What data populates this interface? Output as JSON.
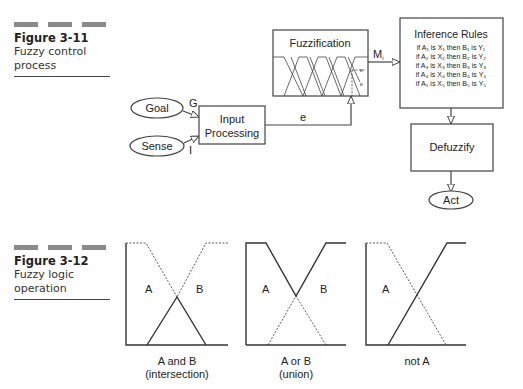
{
  "figure_3_11": {
    "number": "Figure 3-11",
    "title": "Fuzzy control process",
    "nodes": {
      "goal": "Goal",
      "sense": "Sense",
      "input_processing_line1": "Input",
      "input_processing_line2": "Processing",
      "fuzzification": "Fuzzification",
      "inference_title": "Inference Rules",
      "defuzzify": "Defuzzify",
      "act": "Act"
    },
    "edge_labels": {
      "goal": "G",
      "sense": "I",
      "error": "e",
      "membership": "Mi"
    },
    "rules": [
      "if A₁ is X₁ then B₁ is Y₁",
      "if A₂ is X₂ then B₂ is Y₂",
      "if A₃ is X₃ then B₃ is Y₃",
      "if A₄ is X₄ then B₄ is Y₄",
      "if A₅ is X₅ then B₅ is Y₅"
    ]
  },
  "figure_3_12": {
    "number": "Figure 3-12",
    "title": "Fuzzy logic operation",
    "panels": [
      {
        "label_a": "A",
        "label_b": "B",
        "caption_line1": "A and B",
        "caption_line2": "(intersection)"
      },
      {
        "label_a": "A",
        "label_b": "B",
        "caption_line1": "A or B",
        "caption_line2": "(union)"
      },
      {
        "label_a": "A",
        "caption_line1": "not A"
      }
    ]
  }
}
